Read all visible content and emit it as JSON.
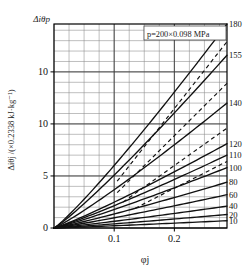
{
  "figure": {
    "corner_label": "Δiθp",
    "annotation": "p=200×0.098 MPa",
    "background": "#ffffff",
    "line_color": "#111111",
    "grid_color": "#555555",
    "axis_color": "#000000"
  },
  "chart_data": {
    "type": "line",
    "title": "",
    "annotation": "p=200×0.098 MPa",
    "xlabel": "φj",
    "ylabel": "Δiθj /(×0.2338 kJ·kg⁻¹)",
    "corner_ylabel": "Δiθp",
    "xlim": [
      0,
      0.2875
    ],
    "ylim": [
      0,
      19.6
    ],
    "grid": true,
    "x_major_ticks": [
      0.1,
      0.2
    ],
    "x_major_tick_labels": [
      "0.1",
      "0.2"
    ],
    "x_minor_step": 0.025,
    "y_major_ticks": [
      0,
      5,
      10,
      15
    ],
    "y_major_tick_labels": [
      "0",
      "5",
      "10",
      "10"
    ],
    "y_minor_step": 1,
    "legend_position": "right-inline-labels",
    "series": [
      {
        "name": "180",
        "label": "180",
        "style": "solid",
        "values": [
          [
            0,
            0
          ],
          [
            0.2875,
            19.6
          ]
        ]
      },
      {
        "name": "155",
        "label": "155",
        "style": "solid",
        "values": [
          [
            0,
            0
          ],
          [
            0.2875,
            16.6
          ]
        ]
      },
      {
        "name": "140",
        "label": "140",
        "style": "solid",
        "values": [
          [
            0,
            0
          ],
          [
            0.2875,
            12.0
          ]
        ]
      },
      {
        "name": "120",
        "label": "120",
        "style": "solid",
        "values": [
          [
            0,
            0
          ],
          [
            0.2875,
            8.1
          ]
        ]
      },
      {
        "name": "110",
        "label": "110",
        "style": "solid",
        "values": [
          [
            0,
            0
          ],
          [
            0.2875,
            7.0
          ]
        ]
      },
      {
        "name": "100",
        "label": "100",
        "style": "solid",
        "values": [
          [
            0,
            0
          ],
          [
            0.2875,
            5.8
          ]
        ]
      },
      {
        "name": "80",
        "label": "80",
        "style": "solid",
        "values": [
          [
            0,
            0
          ],
          [
            0.2875,
            4.4
          ]
        ]
      },
      {
        "name": "60",
        "label": "60",
        "style": "solid",
        "values": [
          [
            0,
            0
          ],
          [
            0.2875,
            3.2
          ]
        ]
      },
      {
        "name": "40",
        "label": "40",
        "style": "solid",
        "values": [
          [
            0,
            0
          ],
          [
            0.2875,
            2.1
          ]
        ]
      },
      {
        "name": "20",
        "label": "20",
        "style": "solid",
        "values": [
          [
            0,
            0
          ],
          [
            0.2875,
            1.3
          ]
        ]
      },
      {
        "name": "10",
        "label": "10",
        "style": "solid",
        "values": [
          [
            0,
            0
          ],
          [
            0.2875,
            0.7
          ]
        ]
      }
    ],
    "dashed_guides": [
      {
        "name": "guide-a",
        "values": [
          [
            0.105,
            4.5
          ],
          [
            0.2875,
            17.9
          ]
        ]
      },
      {
        "name": "guide-b",
        "values": [
          [
            0.105,
            3.4
          ],
          [
            0.2875,
            13.9
          ]
        ]
      },
      {
        "name": "guide-c",
        "values": [
          [
            0.115,
            2.5
          ],
          [
            0.2875,
            9.6
          ]
        ]
      },
      {
        "name": "guide-d",
        "values": [
          [
            0.135,
            1.9
          ],
          [
            0.2875,
            6.4
          ]
        ]
      }
    ],
    "curve_labels": [
      "180",
      "155",
      "140",
      "120",
      "110",
      "100",
      "80",
      "60",
      "40",
      "20",
      "10"
    ]
  }
}
